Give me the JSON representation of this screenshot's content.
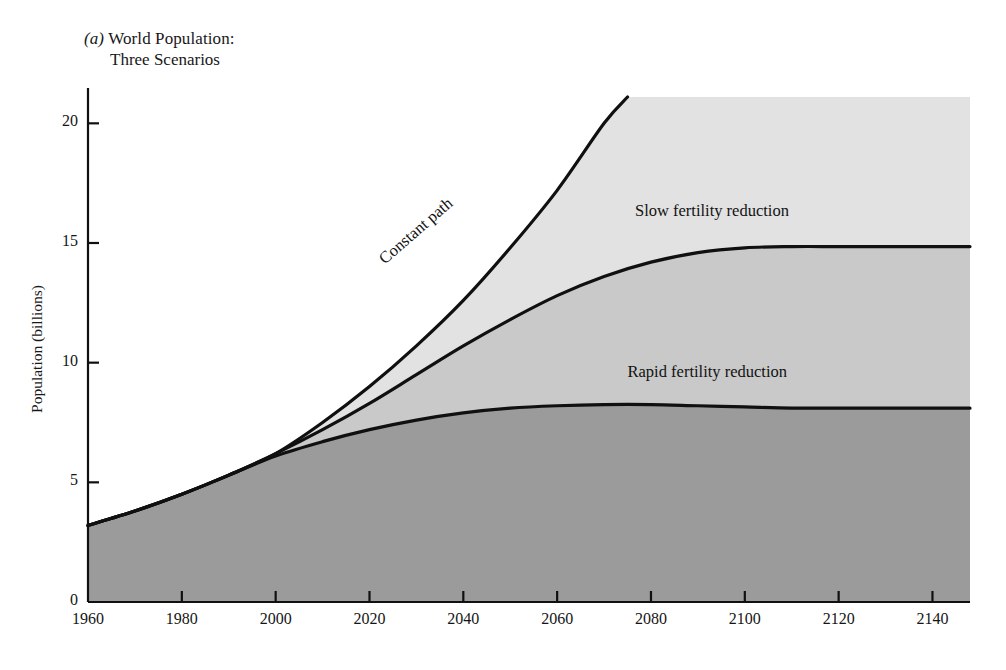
{
  "figure": {
    "panel_marker": "(a)",
    "title_line1": "World Population:",
    "title_line2": "Three Scenarios"
  },
  "chart_data": {
    "type": "area",
    "title": "(a) World Population: Three Scenarios",
    "xlabel": "",
    "ylabel": "Population (billions)",
    "xlim": [
      1960,
      2148
    ],
    "ylim": [
      0,
      21.5
    ],
    "grid": false,
    "legend": "inline-labels",
    "xticks": [
      1960,
      1980,
      2000,
      2020,
      2040,
      2060,
      2080,
      2100,
      2120,
      2140
    ],
    "yticks": [
      0,
      5,
      10,
      15,
      20
    ],
    "colors": {
      "band_rapid": "#9b9b9b",
      "band_slow": "#c9c9c9",
      "band_constant": "#e2e2e2",
      "line": "#101010",
      "axis": "#101010"
    },
    "series": [
      {
        "name": "Constant path",
        "label": "Constant path",
        "label_rotation_deg": -41,
        "x": [
          1960,
          1970,
          1980,
          1990,
          2000,
          2010,
          2020,
          2030,
          2040,
          2050,
          2060,
          2070,
          2075
        ],
        "values": [
          3.2,
          3.8,
          4.5,
          5.3,
          6.2,
          7.5,
          9.0,
          10.7,
          12.6,
          14.8,
          17.2,
          20.0,
          21.1
        ]
      },
      {
        "name": "Slow fertility reduction",
        "label": "Slow fertility reduction",
        "label_rotation_deg": 0,
        "x": [
          1960,
          1970,
          1980,
          1990,
          2000,
          2010,
          2020,
          2030,
          2040,
          2050,
          2060,
          2070,
          2080,
          2090,
          2100,
          2110,
          2120,
          2130,
          2140,
          2148
        ],
        "values": [
          3.2,
          3.8,
          4.5,
          5.3,
          6.2,
          7.2,
          8.3,
          9.5,
          10.7,
          11.8,
          12.8,
          13.6,
          14.2,
          14.6,
          14.8,
          14.85,
          14.85,
          14.85,
          14.85,
          14.85
        ]
      },
      {
        "name": "Rapid fertility reduction",
        "label": "Rapid fertility reduction",
        "label_rotation_deg": 0,
        "x": [
          1960,
          1970,
          1980,
          1990,
          2000,
          2010,
          2020,
          2030,
          2040,
          2050,
          2060,
          2070,
          2080,
          2090,
          2100,
          2110,
          2120,
          2130,
          2140,
          2148
        ],
        "values": [
          3.2,
          3.8,
          4.5,
          5.3,
          6.1,
          6.7,
          7.2,
          7.6,
          7.9,
          8.1,
          8.2,
          8.25,
          8.25,
          8.2,
          8.15,
          8.1,
          8.1,
          8.1,
          8.1,
          8.1
        ]
      }
    ],
    "annotations": [
      {
        "text": "Constant path",
        "x": 2030,
        "y": 15.5,
        "rotation_deg": -41
      },
      {
        "text": "Slow fertility reduction",
        "x": 2093,
        "y": 15.9,
        "rotation_deg": 0
      },
      {
        "text": "Rapid fertility reduction",
        "x": 2092,
        "y": 9.2,
        "rotation_deg": 0
      }
    ]
  }
}
